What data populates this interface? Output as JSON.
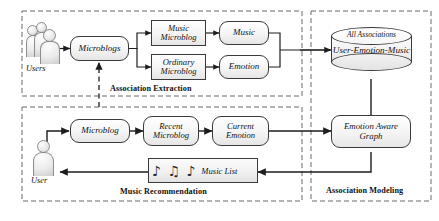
{
  "figure": {
    "stroke_color": "#3a3a3a",
    "dash_color": "#6a6a6a",
    "fill_color": "#f0f0f0"
  },
  "sections": [
    {
      "id": "association-extraction",
      "label": "Association Extraction"
    },
    {
      "id": "association-modeling",
      "label": "Association Modeling"
    },
    {
      "id": "music-recommendation",
      "label": "Music Recommendation"
    }
  ],
  "actors": [
    {
      "id": "users",
      "label": "Users",
      "icon": "users-group-icon",
      "count": 3
    },
    {
      "id": "user",
      "label": "User",
      "icon": "user-person-icon",
      "count": 1
    }
  ],
  "nodes": {
    "microblogs": {
      "label": "Microblogs",
      "shape": "rounded"
    },
    "music_microblog": {
      "line1": "Music",
      "line2": "Microblog",
      "shape": "rect"
    },
    "ordinary_microblog": {
      "line1": "Ordinary",
      "line2": "Microblog",
      "shape": "rect"
    },
    "music": {
      "label": "Music",
      "shape": "rounded"
    },
    "emotion": {
      "label": "Emotion",
      "shape": "rounded"
    },
    "microblog": {
      "label": "Microblog",
      "shape": "rounded"
    },
    "recent_microblog": {
      "line1": "Recent",
      "line2": "Microblog",
      "shape": "rounded"
    },
    "current_emotion": {
      "line1": "Current",
      "line2": "Emotion",
      "shape": "rounded"
    },
    "emotion_aware_graph": {
      "line1": "Emotion Aware",
      "line2": "Graph",
      "shape": "rounded"
    }
  },
  "database": {
    "top_label": "All Associations",
    "body_label": "User-Emotion-Music",
    "shape": "cylinder"
  },
  "music_list": {
    "label": "Music List",
    "notes": "♪ ♫ ♪",
    "icon": "music-notes-icon"
  }
}
